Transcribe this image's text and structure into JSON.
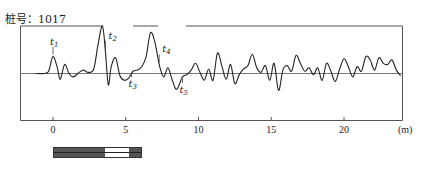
{
  "header": {
    "pile_label": "桩号：1017"
  },
  "chart_data": {
    "type": "line",
    "title": "桩号：1017",
    "xlabel": "(m)",
    "ylabel": "",
    "x_ticks": [
      0,
      5,
      10,
      15,
      20
    ],
    "x_tick_labels": [
      "0",
      "5",
      "10",
      "15",
      "20"
    ],
    "x_unit_label": "(m)",
    "xlim": [
      -2.3,
      23.9
    ],
    "grid": false,
    "legend": null,
    "baseline": 0,
    "annotations": [
      {
        "label": "t",
        "sub": "1",
        "x": 0.0,
        "position": "above"
      },
      {
        "label": "t",
        "sub": "2",
        "x": 3.6,
        "position": "above"
      },
      {
        "label": "t",
        "sub": "3",
        "x": 5.4,
        "position": "below"
      },
      {
        "label": "t",
        "sub": "4",
        "x": 7.3,
        "position": "above"
      },
      {
        "label": "t",
        "sub": "5",
        "x": 8.9,
        "position": "below"
      }
    ],
    "series": [
      {
        "name": "reflected wave signal",
        "x": [
          -1.2,
          -0.6,
          -0.3,
          0.0,
          0.3,
          0.5,
          0.8,
          1.1,
          1.4,
          1.8,
          2.1,
          2.4,
          2.8,
          3.1,
          3.4,
          3.6,
          3.8,
          4.0,
          4.3,
          4.6,
          4.9,
          5.2,
          5.5,
          5.8,
          6.1,
          6.4,
          6.7,
          7.0,
          7.3,
          7.6,
          7.9,
          8.2,
          8.5,
          8.9,
          9.2,
          9.5,
          9.8,
          10.1,
          10.4,
          10.7,
          11.0,
          11.3,
          11.6,
          11.9,
          12.2,
          12.5,
          12.8,
          13.1,
          13.4,
          13.7,
          14.0,
          14.3,
          14.6,
          14.9,
          15.2,
          15.5,
          15.8,
          16.1,
          16.4,
          16.7,
          17.0,
          17.3,
          17.6,
          17.9,
          18.2,
          18.5,
          18.8,
          19.1,
          19.4,
          19.7,
          20.0,
          20.3,
          20.6,
          20.9,
          21.2,
          21.5,
          21.8,
          22.1,
          22.4,
          22.7,
          23.0,
          23.3,
          23.6,
          23.9
        ],
        "y": [
          0,
          0,
          0.2,
          1.5,
          0.5,
          -0.5,
          0.8,
          0,
          -0.3,
          0.1,
          0.3,
          0.1,
          0.4,
          2.6,
          4.2,
          2.0,
          -1.0,
          0.6,
          1.4,
          -0.2,
          -0.6,
          -0.4,
          0.2,
          0.3,
          0.6,
          1.5,
          3.6,
          2.8,
          0.8,
          -0.3,
          0.5,
          -0.6,
          -1.4,
          -0.3,
          -0.1,
          0.3,
          0.9,
          0.1,
          -0.6,
          0.4,
          -0.6,
          1.8,
          0.7,
          -0.5,
          0.8,
          -0.9,
          -0.1,
          0.4,
          0.7,
          1.7,
          0.5,
          0.1,
          0.7,
          -0.6,
          0.9,
          -1.5,
          0.3,
          0.7,
          0.2,
          1.6,
          0.9,
          0.2,
          0.5,
          -0.1,
          0.5,
          -0.6,
          0.9,
          0.2,
          -0.7,
          0.4,
          1.3,
          0.6,
          -0.3,
          0.6,
          0.2,
          1.5,
          1.2,
          0.3,
          1.4,
          0.9,
          0.8,
          1.2,
          0.3,
          -0.2
        ]
      }
    ]
  },
  "pile_diagram": {
    "segments": [
      {
        "role": "pile-body",
        "color": "#555555",
        "width": 52
      },
      {
        "role": "defect-zone",
        "color": "#ffffff",
        "width": 24
      },
      {
        "role": "pile-tip",
        "color": "#555555",
        "width": 13
      }
    ]
  }
}
